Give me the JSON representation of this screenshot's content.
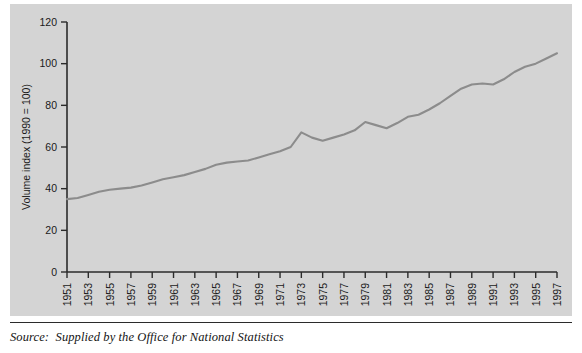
{
  "figure": {
    "background_color": "#ffffff",
    "panel_color": "#d4d4d4",
    "axis_color": "#2b2b2b",
    "line_color": "#8c8c8c",
    "source_note": "Source:  Supplied by the Office for National Statistics"
  },
  "chart_data": {
    "type": "line",
    "title": "",
    "subtitle": "",
    "xlabel": "",
    "ylabel": "Volume index (1990 = 100)",
    "ylim": [
      0,
      120
    ],
    "xlim": [
      1951,
      1997
    ],
    "yticks": [
      0,
      20,
      40,
      60,
      80,
      100,
      120
    ],
    "ytick_labels": [
      "0",
      "20",
      "40",
      "60",
      "80",
      "100",
      "120"
    ],
    "xticks": [
      1951,
      1953,
      1955,
      1957,
      1959,
      1961,
      1963,
      1965,
      1967,
      1969,
      1971,
      1973,
      1975,
      1977,
      1979,
      1981,
      1983,
      1985,
      1987,
      1989,
      1991,
      1993,
      1995,
      1997
    ],
    "xtick_labels": [
      "1951",
      "1953",
      "1955",
      "1957",
      "1959",
      "1961",
      "1963",
      "1965",
      "1967",
      "1969",
      "1971",
      "1973",
      "1975",
      "1977",
      "1979",
      "1981",
      "1983",
      "1985",
      "1987",
      "1989",
      "1991",
      "1993",
      "1995",
      "1997"
    ],
    "xtick_rotation": 90,
    "grid": false,
    "legend": false,
    "legend_position": "none",
    "series": [
      {
        "name": "Volume index",
        "color": "#8c8c8c",
        "x": [
          1951,
          1952,
          1953,
          1954,
          1955,
          1956,
          1957,
          1958,
          1959,
          1960,
          1961,
          1962,
          1963,
          1964,
          1965,
          1966,
          1967,
          1968,
          1969,
          1970,
          1971,
          1972,
          1973,
          1974,
          1975,
          1976,
          1977,
          1978,
          1979,
          1980,
          1981,
          1982,
          1983,
          1984,
          1985,
          1986,
          1987,
          1988,
          1989,
          1990,
          1991,
          1992,
          1993,
          1994,
          1995,
          1996,
          1997
        ],
        "values": [
          35,
          35.5,
          37,
          38.5,
          39.5,
          40,
          40.5,
          41.5,
          43,
          44.5,
          45.5,
          46.5,
          48,
          49.5,
          51.5,
          52.5,
          53,
          53.5,
          55,
          56.5,
          58,
          60,
          67,
          64.5,
          63,
          64.5,
          66,
          68,
          72,
          70.5,
          69,
          71.5,
          74.5,
          75.5,
          78,
          81,
          84.5,
          88,
          90,
          90.5,
          90,
          92.5,
          96,
          98.5,
          100,
          102.5,
          105
        ]
      }
    ]
  }
}
